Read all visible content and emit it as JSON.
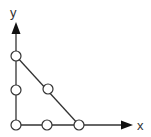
{
  "diagram": {
    "axis_labels": {
      "x": "x",
      "y": "y"
    },
    "nodes": [
      {
        "id": "origin",
        "x": 16,
        "y": 125
      },
      {
        "id": "y-mid",
        "x": 16,
        "y": 90
      },
      {
        "id": "y-top",
        "x": 16,
        "y": 56
      },
      {
        "id": "x-mid",
        "x": 47,
        "y": 125
      },
      {
        "id": "x-end",
        "x": 79,
        "y": 125
      },
      {
        "id": "hyp-mid",
        "x": 48,
        "y": 89
      }
    ],
    "edges": [
      [
        "origin",
        "y-top"
      ],
      [
        "origin",
        "x-end"
      ],
      [
        "y-top",
        "x-end"
      ]
    ],
    "colors": {
      "line": "#333333",
      "node_fill": "#ffffff",
      "node_stroke": "#333333"
    }
  }
}
